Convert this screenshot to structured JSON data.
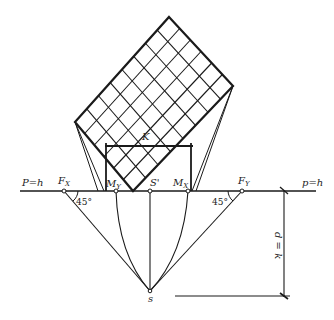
{
  "diagram": {
    "type": "perspective-construction",
    "colors": {
      "ink": "#1a1a1a",
      "background": "#ffffff"
    },
    "horizon": {
      "left_label": "P=h",
      "right_label": "p=h"
    },
    "points": {
      "F_x": {
        "main": "F",
        "sub": "X"
      },
      "M_y": {
        "main": "M",
        "sub": "Y"
      },
      "S_prime": {
        "main": "S'"
      },
      "M_x": {
        "main": "M",
        "sub": "X"
      },
      "F_y": {
        "main": "F",
        "sub": "Y"
      },
      "S": {
        "main": "s"
      }
    },
    "angles": {
      "left": "45°",
      "right": "45°"
    },
    "dimension_k": "K",
    "distance_label": "d = k",
    "grid": {
      "rows": 8,
      "cols": 6
    }
  }
}
